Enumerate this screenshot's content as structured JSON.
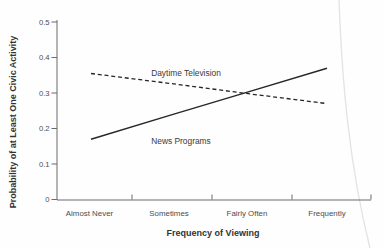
{
  "chart_data": {
    "type": "line",
    "title": "",
    "categories": [
      "Almost Never",
      "Sometimes",
      "Fairly Often",
      "Frequently"
    ],
    "series": [
      {
        "name": "Daytime Television",
        "line_style": "dashed",
        "values": [
          0.355,
          0.327,
          0.298,
          0.27
        ]
      },
      {
        "name": "News Programs",
        "line_style": "solid",
        "values": [
          0.17,
          0.237,
          0.303,
          0.37
        ]
      }
    ],
    "xlabel": "Frequency of Viewing",
    "ylabel": "Probability of at Least One Civic Activity",
    "ylim": [
      0,
      0.5
    ],
    "yticks": [
      0,
      0.1,
      0.2,
      0.3,
      0.4,
      0.5
    ],
    "ytick_labels": [
      "0",
      "0.1",
      "0.2",
      "0.3",
      "0.4",
      "0.5"
    ],
    "grid": false,
    "legend": "inline-labels",
    "colors": {
      "line": "#262626",
      "axis": "#6a6a6a",
      "tick_text": "#4d4d4d",
      "label_text": "#3a3a3a",
      "scan_artifact": "#e3e3e0"
    }
  }
}
